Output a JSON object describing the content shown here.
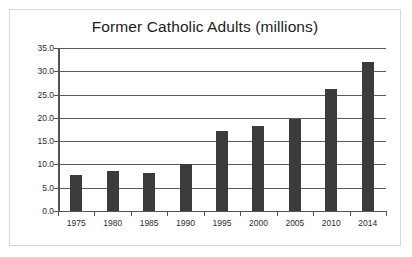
{
  "chart_data": {
    "type": "bar",
    "title": "Former Catholic Adults (millions)",
    "xlabel": "",
    "ylabel": "",
    "categories": [
      "1975",
      "1980",
      "1985",
      "1990",
      "1995",
      "2000",
      "2005",
      "2010",
      "2014"
    ],
    "values": [
      7.7,
      8.6,
      8.1,
      10.1,
      17.2,
      18.3,
      19.7,
      26.3,
      32.0
    ],
    "ylim": [
      0.0,
      35.0
    ],
    "ytick_step": 5.0,
    "ytick_labels": [
      "0.0",
      "5.0",
      "10.0",
      "15.0",
      "20.0",
      "25.0",
      "30.0",
      "35.0"
    ],
    "ytick_values": [
      0.0,
      5.0,
      10.0,
      15.0,
      20.0,
      25.0,
      30.0,
      35.0
    ],
    "grid": true,
    "legend": false,
    "legend_position": "none",
    "bar_color": "#3b3b3b",
    "axis_color": "#555555",
    "gridline_color": "#5a5a5a",
    "background_color": "#ffffff",
    "frame_color": "#d8d8d8",
    "title_color": "#1c1c1c"
  }
}
